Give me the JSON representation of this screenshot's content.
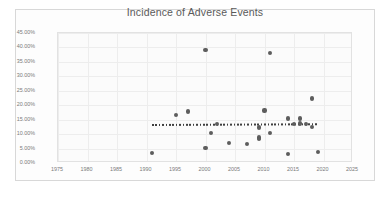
{
  "chart_data": {
    "type": "scatter",
    "title": "Incidence of Adverse Events",
    "xlabel": "",
    "ylabel": "",
    "xlim": [
      1975,
      2025
    ],
    "ylim": [
      0,
      45
    ],
    "xticks": [
      "1975",
      "1980",
      "1985",
      "1990",
      "1995",
      "2000",
      "2005",
      "2010",
      "2015",
      "2020",
      "2025"
    ],
    "xtick_values": [
      1975,
      1980,
      1985,
      1990,
      1995,
      2000,
      2005,
      2010,
      2015,
      2020,
      2025
    ],
    "yticks": [
      "0.00%",
      "5.00%",
      "10.00%",
      "15.00%",
      "20.00%",
      "25.00%",
      "30.00%",
      "35.00%",
      "40.00%",
      "45.00%"
    ],
    "ytick_values": [
      0,
      5,
      10,
      15,
      20,
      25,
      30,
      35,
      40,
      45
    ],
    "grid": true,
    "legend": false,
    "series": [
      {
        "name": "Incidence of Adverse Events",
        "marker": "circle",
        "color": "#5d5d5d",
        "points": [
          {
            "x": 1991,
            "y": 3.5
          },
          {
            "x": 1995,
            "y": 16.6
          },
          {
            "x": 1997,
            "y": 17.8
          },
          {
            "x": 2000,
            "y": 39.2
          },
          {
            "x": 2000,
            "y": 5.2
          },
          {
            "x": 2001,
            "y": 10.5
          },
          {
            "x": 2002,
            "y": 13.4
          },
          {
            "x": 2004,
            "y": 6.9
          },
          {
            "x": 2007,
            "y": 6.7
          },
          {
            "x": 2009,
            "y": 12.3
          },
          {
            "x": 2009,
            "y": 8.8
          },
          {
            "x": 2009,
            "y": 8.3
          },
          {
            "x": 2010,
            "y": 18.2
          },
          {
            "x": 2011,
            "y": 38.0
          },
          {
            "x": 2011,
            "y": 10.4
          },
          {
            "x": 2014,
            "y": 3.0
          },
          {
            "x": 2014,
            "y": 15.4
          },
          {
            "x": 2015,
            "y": 13.6
          },
          {
            "x": 2016,
            "y": 15.4
          },
          {
            "x": 2016,
            "y": 13.7
          },
          {
            "x": 2017,
            "y": 13.6
          },
          {
            "x": 2018,
            "y": 22.3
          },
          {
            "x": 2018,
            "y": 12.4
          },
          {
            "x": 2019,
            "y": 3.9
          }
        ]
      }
    ],
    "trendline": {
      "name": "linear-trendline",
      "style": "dotted",
      "color": "#3f3f3f",
      "x_start": 1991,
      "x_end": 2019,
      "y_start": 13.4,
      "y_end": 13.7
    }
  }
}
